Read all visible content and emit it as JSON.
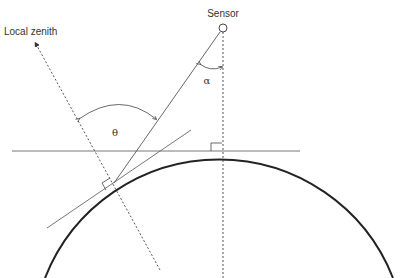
{
  "diagram": {
    "labels": {
      "sensor": "Sensor",
      "local_zenith": "Local zenith",
      "theta": "θ",
      "alpha": "α"
    },
    "elements": [
      {
        "id": "earth-surface",
        "type": "arc",
        "description": "Curved Earth surface"
      },
      {
        "id": "sensor",
        "type": "point",
        "description": "Sensor position (small circle)"
      },
      {
        "id": "nadir-line",
        "type": "dashed-line",
        "description": "Vertical from sensor to nadir"
      },
      {
        "id": "line-of-sight",
        "type": "line",
        "description": "Sensor line of sight to surface point"
      },
      {
        "id": "local-zenith",
        "type": "dashed-arrow",
        "description": "Local zenith direction at viewed point"
      },
      {
        "id": "nadir-tangent",
        "type": "line",
        "description": "Horizontal tangent at nadir"
      },
      {
        "id": "local-tangent",
        "type": "line",
        "description": "Tangent at viewed point"
      },
      {
        "id": "view-zenith-angle",
        "type": "angle",
        "label": "θ"
      },
      {
        "id": "sensor-look-angle",
        "type": "angle",
        "label": "α"
      }
    ],
    "colors": {
      "ink": "#333333",
      "earth": "#222222",
      "thin": "#555555"
    }
  }
}
